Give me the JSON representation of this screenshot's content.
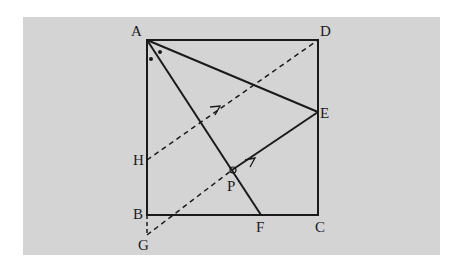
{
  "figure": {
    "background": "#d4d4d4",
    "line_color": "#1a1a1a",
    "points": {
      "A": {
        "label": "A",
        "x": 147,
        "y": 40
      },
      "B": {
        "label": "B",
        "x": 147,
        "y": 215
      },
      "C": {
        "label": "C",
        "x": 318,
        "y": 215
      },
      "D": {
        "label": "D",
        "x": 318,
        "y": 40
      },
      "E": {
        "label": "E",
        "x": 318,
        "y": 112
      },
      "F": {
        "label": "F",
        "x": 261,
        "y": 215
      },
      "G": {
        "label": "G",
        "x": 147,
        "y": 235
      },
      "H": {
        "label": "H",
        "x": 147,
        "y": 160
      },
      "P": {
        "label": "P",
        "x": 232,
        "y": 170
      }
    },
    "segments_solid": [
      "AB",
      "BC",
      "CD",
      "DA",
      "AE",
      "AF",
      "PE"
    ],
    "segments_dashed": [
      "HD",
      "GP"
    ],
    "markers": {
      "angle_marks": "two dots at A (equal angles BAF and FAE)",
      "right_angle": "small circle at P",
      "parallel_arrows": [
        "on HD",
        "on GE"
      ]
    }
  }
}
